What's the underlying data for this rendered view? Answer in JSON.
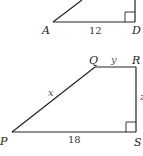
{
  "figure_top": {
    "vertices": {
      "A": "A",
      "D": "D"
    },
    "side_labels": {
      "AD": "12"
    },
    "right_angle_at": "D"
  },
  "figure_bottom": {
    "vertices": {
      "P": "P",
      "Q": "Q",
      "R": "R",
      "S": "S"
    },
    "side_labels": {
      "PS": "18",
      "QR": "y",
      "PQ": "x",
      "RS": "z"
    },
    "right_angle_at": "S"
  },
  "colors": {
    "stroke": "#222222",
    "background": "#ffffff"
  }
}
